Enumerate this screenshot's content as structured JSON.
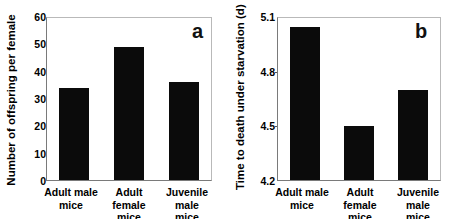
{
  "figure": {
    "panels": [
      {
        "letter": "a",
        "ylabel": "Number of offspring per female",
        "chart": {
          "type": "bar",
          "categories": [
            "Adult male mice",
            "Adult female mice",
            "Juvenile male mice"
          ],
          "category_lines": [
            [
              "Adult male",
              "mice"
            ],
            [
              "Adult female",
              "mice"
            ],
            [
              "Juvenile male",
              "mice"
            ]
          ],
          "values": [
            34.1,
            49.4,
            36.3
          ],
          "title": "",
          "xlabel": "",
          "ylabel": "Number of offspring per female",
          "ylim": [
            0,
            60
          ],
          "yticks": [
            0,
            10,
            20,
            30,
            40,
            50,
            60
          ],
          "ytick_labels": [
            "0",
            "10",
            "20",
            "30",
            "40",
            "50",
            "60"
          ],
          "grid": false,
          "legend": "none",
          "bar_color": "#0b0b0b"
        }
      },
      {
        "letter": "b",
        "ylabel": "Time to death under starvation (d)",
        "chart": {
          "type": "bar",
          "categories": [
            "Adult male mice",
            "Adult female mice",
            "Juvenile male mice"
          ],
          "category_lines": [
            [
              "Adult male",
              "mice"
            ],
            [
              "Adult female",
              "mice"
            ],
            [
              "Juvenile male",
              "mice"
            ]
          ],
          "values": [
            5.05,
            4.5,
            4.7
          ],
          "title": "",
          "xlabel": "",
          "ylabel": "Time to death under starvation (d)",
          "ylim": [
            4.2,
            5.1
          ],
          "yticks": [
            4.2,
            4.5,
            4.8,
            5.1
          ],
          "ytick_labels": [
            "4.2",
            "4.5",
            "4.8",
            "5.1"
          ],
          "grid": false,
          "legend": "none",
          "bar_color": "#0b0b0b"
        }
      }
    ]
  },
  "chart_data": [
    {
      "type": "bar",
      "panel": "a",
      "categories": [
        "Adult male mice",
        "Adult female mice",
        "Juvenile male mice"
      ],
      "values": [
        34.1,
        49.4,
        36.3
      ],
      "title": "",
      "xlabel": "",
      "ylabel": "Number of offspring per female",
      "ylim": [
        0,
        60
      ],
      "yticks": [
        0,
        10,
        20,
        30,
        40,
        50,
        60
      ],
      "grid": false,
      "legend": "none"
    },
    {
      "type": "bar",
      "panel": "b",
      "categories": [
        "Adult male mice",
        "Adult female mice",
        "Juvenile male mice"
      ],
      "values": [
        5.05,
        4.5,
        4.7
      ],
      "title": "",
      "xlabel": "",
      "ylabel": "Time to death under starvation (d)",
      "ylim": [
        4.2,
        5.1
      ],
      "yticks": [
        4.2,
        4.5,
        4.8,
        5.1
      ],
      "grid": false,
      "legend": "none"
    }
  ]
}
